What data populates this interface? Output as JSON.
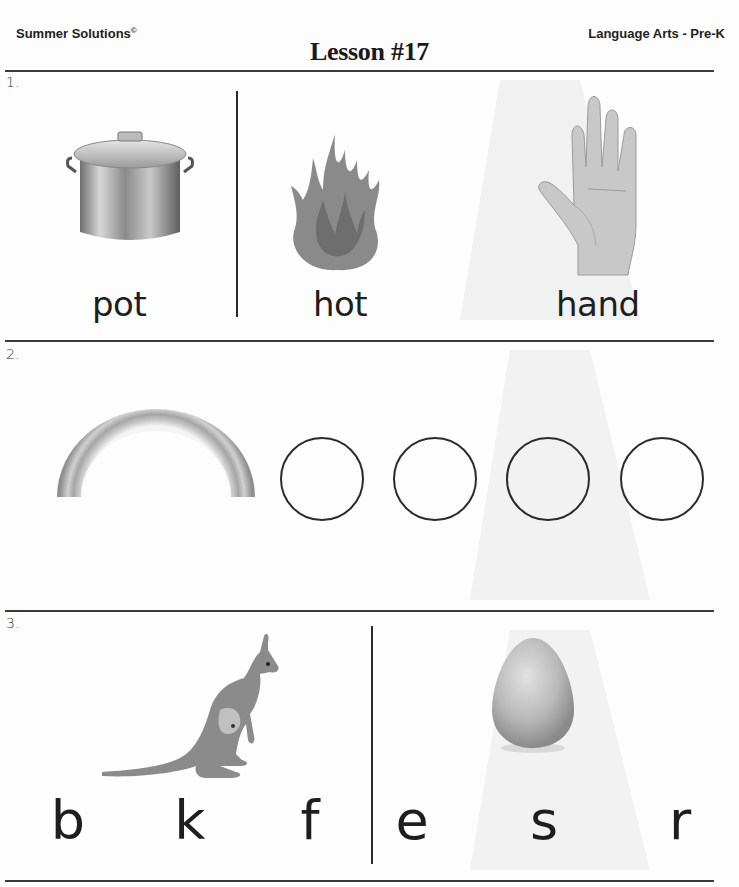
{
  "header": {
    "brand": "Summer Solutions",
    "brand_mark": "©",
    "subject": "Language Arts - Pre-K",
    "title": "Lesson #17"
  },
  "sections": [
    {
      "number": "1.",
      "items": [
        {
          "picture": "pot-icon",
          "word": "pot"
        },
        {
          "picture": "fire-icon",
          "word": "hot"
        },
        {
          "picture": "hand-icon",
          "word": "hand"
        }
      ]
    },
    {
      "number": "2.",
      "picture": "rainbow-icon",
      "answer_circles": 4
    },
    {
      "number": "3.",
      "groups": [
        {
          "picture": "kangaroo-icon",
          "letters": [
            "b",
            "k",
            "f"
          ]
        },
        {
          "picture": "egg-icon",
          "letters": [
            "e",
            "s",
            "r"
          ]
        }
      ]
    }
  ],
  "colors": {
    "rule": "#3a3a3a",
    "text": "#1e1e1e",
    "watermark": "#efefef"
  }
}
